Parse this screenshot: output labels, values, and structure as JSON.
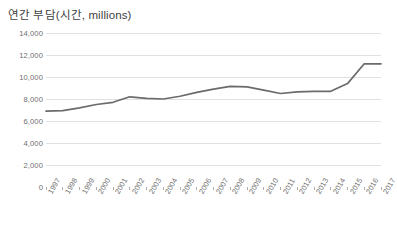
{
  "chart_data": {
    "type": "line",
    "title": "연간 부담(시간, millions)",
    "xlabel": "",
    "ylabel": "",
    "ylim": [
      0,
      14000
    ],
    "ytick_step": 2000,
    "ytick_labels": [
      "14,000",
      "12,000",
      "10,000",
      "8,000",
      "6,000",
      "4,000",
      "2,000",
      "0"
    ],
    "ytick_values": [
      14000,
      12000,
      10000,
      8000,
      6000,
      4000,
      2000,
      0
    ],
    "grid": "horizontal",
    "legend": "none",
    "markers": false,
    "line_color": "#6b6b6b",
    "grid_color": "#d4d4d4",
    "axis_color": "#8c8c8c",
    "text_color": "#6e6e6e",
    "title_color": "#3f3f3f",
    "categories": [
      "1997",
      "1998",
      "1999",
      "2000",
      "2001",
      "2002",
      "2003",
      "2004",
      "2005",
      "2006",
      "2007",
      "2008",
      "2009",
      "2010",
      "2011",
      "2012",
      "2013",
      "2014",
      "2015",
      "2016",
      "2017"
    ],
    "values": [
      6900,
      6950,
      7200,
      7500,
      7700,
      8200,
      8050,
      8000,
      8250,
      8600,
      8900,
      9150,
      9100,
      8800,
      8500,
      8650,
      8700,
      8700,
      9400,
      11200,
      11200
    ]
  }
}
